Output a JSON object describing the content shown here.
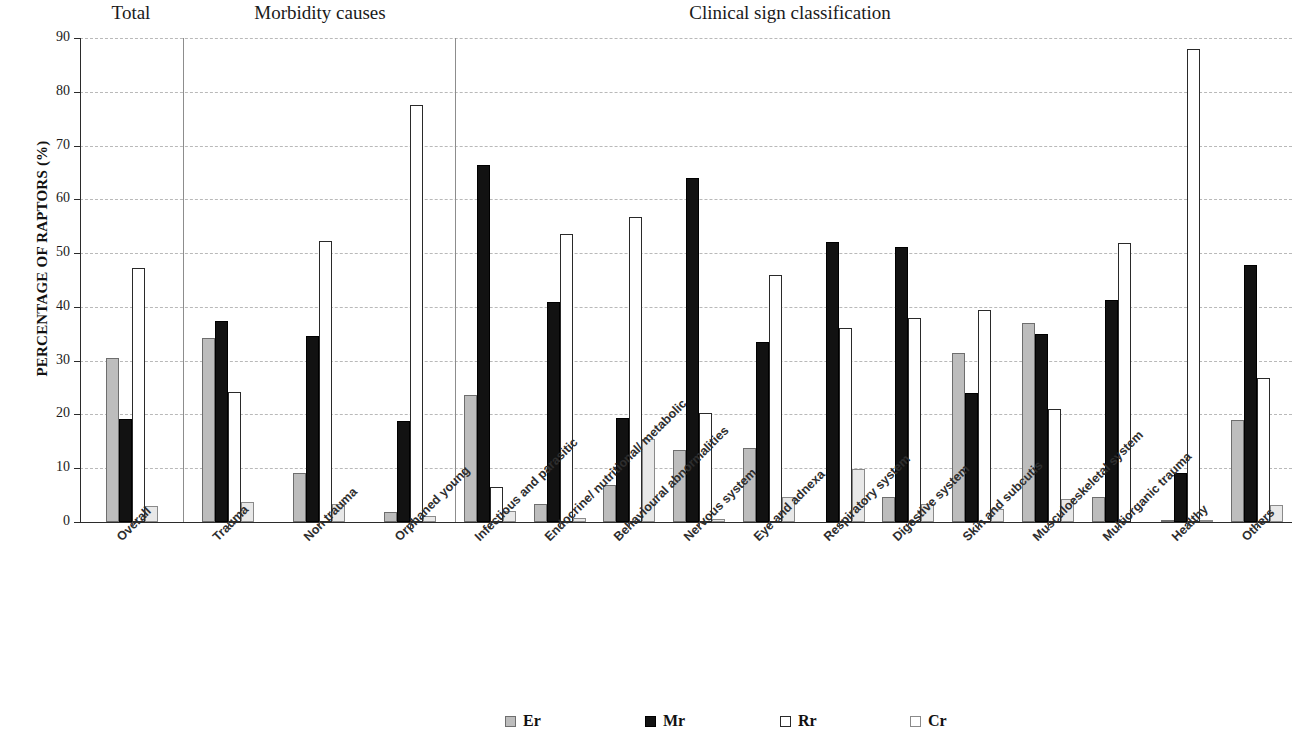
{
  "chart_data": {
    "type": "bar",
    "title": "",
    "xlabel": "",
    "ylabel": "PERCENTAGE OF RAPTORS (%)",
    "ylim": [
      0,
      90
    ],
    "yticks": [
      0,
      10,
      20,
      30,
      40,
      50,
      60,
      70,
      80,
      90
    ],
    "grid": true,
    "legend_position": "bottom",
    "panels": [
      {
        "title": "Total",
        "categories": [
          "Overall"
        ]
      },
      {
        "title": "Morbidity causes",
        "categories": [
          "Trauma",
          "Non trauma",
          "Orphaned young"
        ]
      },
      {
        "title": "Clinical sign classification",
        "categories": [
          "Infectious and parasitic",
          "Endocrine/ nutritional/ metabolic",
          "Behavioural abnormalities",
          "Nervous system",
          "Eye and adnexa",
          "Respiratory system",
          "Digestive system",
          "Skin and subcutis",
          "Musculoeskeletal system",
          "Multiorganic trauma",
          "Healthy",
          "Others"
        ]
      }
    ],
    "categories": [
      "Overall",
      "Trauma",
      "Non trauma",
      "Orphaned young",
      "Infectious and parasitic",
      "Endocrine/ nutritional/ metabolic",
      "Behavioural abnormalities",
      "Nervous system",
      "Eye and adnexa",
      "Respiratory system",
      "Digestive system",
      "Skin and subcutis",
      "Musculoeskeletal system",
      "Multiorganic trauma",
      "Healthy",
      "Others"
    ],
    "series": [
      {
        "name": "Er",
        "color": "#bdbdbd",
        "values": [
          30.5,
          34.2,
          9.1,
          1.9,
          23.6,
          3.4,
          6.9,
          13.4,
          13.7,
          0,
          4.7,
          31.5,
          37.1,
          4.6,
          0.3,
          19.0
        ]
      },
      {
        "name": "Mr",
        "color": "#121212",
        "values": [
          19.2,
          37.4,
          34.6,
          18.8,
          66.3,
          40.9,
          19.3,
          63.9,
          33.4,
          52.1,
          51.2,
          23.9,
          35.0,
          41.3,
          9.2,
          47.7
        ]
      },
      {
        "name": "Rr",
        "color": "#ffffff",
        "values": [
          47.2,
          24.2,
          52.3,
          77.5,
          6.6,
          53.6,
          56.7,
          20.3,
          46.0,
          36.1,
          37.9,
          39.5,
          21.0,
          51.8,
          88.0,
          26.7
        ]
      },
      {
        "name": "Cr",
        "color": "#e8e8e8",
        "values": [
          3.0,
          3.8,
          3.3,
          1.1,
          2.1,
          0.7,
          15.4,
          0.5,
          4.7,
          9.8,
          3.3,
          2.5,
          4.3,
          0,
          0.3,
          3.2
        ]
      }
    ]
  },
  "group_titles": [
    {
      "label": "Total"
    },
    {
      "label": "Morbidity causes"
    },
    {
      "label": "Clinical sign classification"
    }
  ],
  "y_axis": {
    "title": "PERCENTAGE OF RAPTORS (%)",
    "ticks": [
      "0",
      "10",
      "20",
      "30",
      "40",
      "50",
      "60",
      "70",
      "80",
      "90"
    ]
  },
  "legend": {
    "items": [
      {
        "label": "Er",
        "swatch": "er"
      },
      {
        "label": "Mr",
        "swatch": "mr"
      },
      {
        "label": "Rr",
        "swatch": "rr"
      },
      {
        "label": "Cr",
        "swatch": "cr"
      }
    ]
  }
}
